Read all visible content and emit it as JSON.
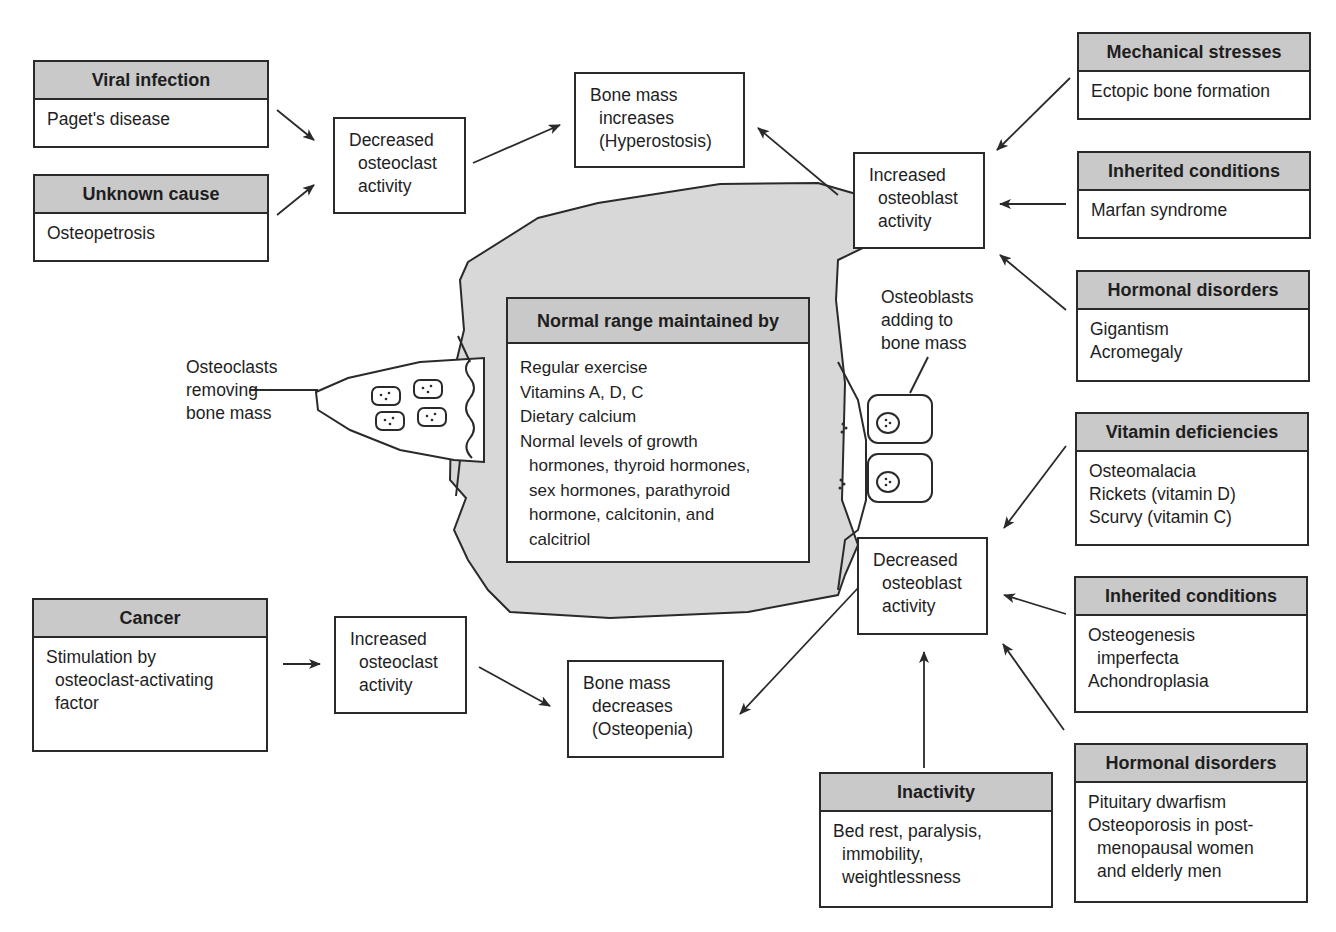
{
  "causes": {
    "viral_infection": {
      "header": "Viral infection",
      "items": [
        "Paget's disease"
      ]
    },
    "unknown_cause": {
      "header": "Unknown cause",
      "items": [
        "Osteopetrosis"
      ]
    },
    "cancer": {
      "header": "Cancer",
      "items": [
        "Stimulation by",
        "osteoclast-activating",
        "factor"
      ]
    },
    "mechanical_stresses": {
      "header": "Mechanical stresses",
      "items": [
        "Ectopic bone formation"
      ]
    },
    "inherited_conditions_up": {
      "header": "Inherited conditions",
      "items": [
        "Marfan syndrome"
      ]
    },
    "hormonal_disorders_up": {
      "header": "Hormonal disorders",
      "items": [
        "Gigantism",
        "Acromegaly"
      ]
    },
    "vitamin_deficiencies": {
      "header": "Vitamin deficiencies",
      "items": [
        "Osteomalacia",
        "Rickets (vitamin D)",
        "Scurvy (vitamin C)"
      ]
    },
    "inherited_conditions_down": {
      "header": "Inherited conditions",
      "items": [
        "Osteogenesis",
        "imperfecta",
        "Achondroplasia"
      ]
    },
    "hormonal_disorders_down": {
      "header": "Hormonal disorders",
      "items": [
        "Pituitary dwarfism",
        "Osteoporosis in post-",
        "menopausal women",
        "and elderly men"
      ]
    },
    "inactivity": {
      "header": "Inactivity",
      "items": [
        "Bed rest, paralysis,",
        "immobility,",
        "weightlessness"
      ]
    }
  },
  "processes": {
    "decreased_osteoclast": [
      "Decreased",
      "osteoclast",
      "activity"
    ],
    "increased_osteoclast": [
      "Increased",
      "osteoclast",
      "activity"
    ],
    "increased_osteoblast": [
      "Increased",
      "osteoblast",
      "activity"
    ],
    "decreased_osteoblast": [
      "Decreased",
      "osteoblast",
      "activity"
    ]
  },
  "outcomes": {
    "bone_mass_increases": [
      "Bone mass",
      "increases",
      "(Hyperostosis)"
    ],
    "bone_mass_decreases": [
      "Bone mass",
      "decreases",
      "(Osteopenia)"
    ]
  },
  "normal_range": {
    "header": "Normal range maintained by",
    "items": [
      "Regular exercise",
      "Vitamins A, D, C",
      "Dietary calcium",
      "Normal levels of growth",
      "hormones, thyroid hormones,",
      "sex hormones, parathyroid",
      "hormone, calcitonin, and",
      "calcitriol"
    ]
  },
  "labels": {
    "osteoclasts": [
      "Osteoclasts",
      "removing",
      "bone mass"
    ],
    "osteoblasts": [
      "Osteoblasts",
      "adding to",
      "bone mass"
    ]
  },
  "colors": {
    "header_fill": "#c9c9c9",
    "bone_fill": "#d8d8d8",
    "line": "#2a2a2a"
  }
}
